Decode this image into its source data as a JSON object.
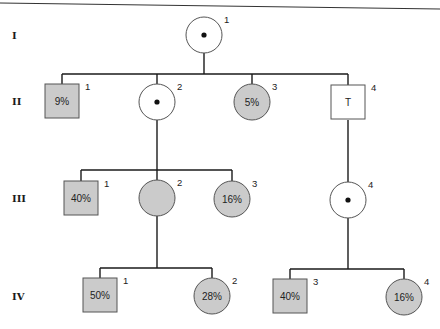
{
  "diagram": {
    "type": "pedigree",
    "colors": {
      "affected": "#cbcbcb",
      "unaffected": "#ffffff",
      "outline": "#555555",
      "line": "#1a1a1a"
    },
    "generations": [
      {
        "label": "I",
        "y": 35
      },
      {
        "label": "II",
        "y": 101
      },
      {
        "label": "III",
        "y": 198
      },
      {
        "label": "IV",
        "y": 296
      }
    ],
    "individuals": [
      {
        "id": "I-1",
        "num": "1",
        "sex": "female",
        "affected": false,
        "carrier_dot": true,
        "text": "",
        "x": 204,
        "y": 35
      },
      {
        "id": "II-1",
        "num": "1",
        "sex": "male",
        "affected": true,
        "carrier_dot": false,
        "text": "9%",
        "x": 62,
        "y": 101
      },
      {
        "id": "II-2",
        "num": "2",
        "sex": "female",
        "affected": false,
        "carrier_dot": true,
        "text": "",
        "x": 157,
        "y": 102
      },
      {
        "id": "II-3",
        "num": "3",
        "sex": "female",
        "affected": true,
        "carrier_dot": false,
        "text": "5%",
        "x": 252,
        "y": 102
      },
      {
        "id": "II-4",
        "num": "4",
        "sex": "male",
        "affected": false,
        "carrier_dot": false,
        "text": "T",
        "x": 348,
        "y": 102
      },
      {
        "id": "III-1",
        "num": "1",
        "sex": "male",
        "affected": true,
        "carrier_dot": false,
        "text": "40%",
        "x": 81,
        "y": 198
      },
      {
        "id": "III-2",
        "num": "2",
        "sex": "female",
        "affected": true,
        "carrier_dot": false,
        "text": "",
        "x": 157,
        "y": 198
      },
      {
        "id": "III-3",
        "num": "3",
        "sex": "female",
        "affected": true,
        "carrier_dot": false,
        "text": "16%",
        "x": 232,
        "y": 199
      },
      {
        "id": "III-4",
        "num": "4",
        "sex": "female",
        "affected": false,
        "carrier_dot": true,
        "text": "",
        "x": 348,
        "y": 200
      },
      {
        "id": "IV-1",
        "num": "1",
        "sex": "male",
        "affected": true,
        "carrier_dot": false,
        "text": "50%",
        "x": 100,
        "y": 295
      },
      {
        "id": "IV-2",
        "num": "2",
        "sex": "female",
        "affected": true,
        "carrier_dot": false,
        "text": "28%",
        "x": 212,
        "y": 296
      },
      {
        "id": "IV-3",
        "num": "3",
        "sex": "male",
        "affected": true,
        "carrier_dot": false,
        "text": "40%",
        "x": 290,
        "y": 296
      },
      {
        "id": "IV-4",
        "num": "4",
        "sex": "female",
        "affected": true,
        "carrier_dot": false,
        "text": "16%",
        "x": 404,
        "y": 297
      }
    ],
    "sibships": [
      {
        "parent": "I-1",
        "parent_x": 204,
        "parent_bottom": 53,
        "bar_y": 74,
        "children": [
          "II-1",
          "II-2",
          "II-3",
          "II-4"
        ]
      },
      {
        "parent": "II-2",
        "parent_x": 157,
        "parent_bottom": 120,
        "bar_y": 170,
        "children": [
          "III-1",
          "III-2",
          "III-3"
        ]
      },
      {
        "parent": "II-4",
        "parent_x": 348,
        "parent_bottom": 120,
        "bar_y": null,
        "children": [
          "III-4"
        ]
      },
      {
        "parent": "III-2",
        "parent_x": 157,
        "parent_bottom": 216,
        "bar_y": 268,
        "children": [
          "IV-1",
          "IV-2"
        ]
      },
      {
        "parent": "III-4",
        "parent_x": 348,
        "parent_bottom": 218,
        "bar_y": 269,
        "children": [
          "IV-3",
          "IV-4"
        ]
      }
    ]
  }
}
